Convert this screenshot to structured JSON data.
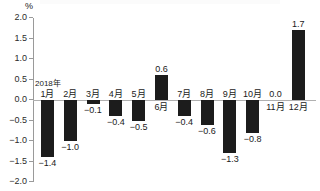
{
  "chart_data": {
    "type": "bar",
    "title": "",
    "subtitle": "",
    "unit_label": "%",
    "xlabel": "",
    "ylabel": "",
    "ylim": [
      -2.0,
      2.0
    ],
    "grid": false,
    "legend": "none",
    "year_annotation": "2018年",
    "categories": [
      "1月",
      "2月",
      "3月",
      "4月",
      "5月",
      "6月",
      "7月",
      "8月",
      "9月",
      "10月",
      "11月",
      "12月"
    ],
    "values": [
      -1.4,
      -1.0,
      -0.1,
      -0.4,
      -0.5,
      0.6,
      -0.4,
      -0.6,
      -1.3,
      -0.8,
      0.0,
      1.7
    ],
    "value_labels": [
      "−1.4",
      "−1.0",
      "−0.1",
      "−0.4",
      "−0.5",
      "0.6",
      "−0.4",
      "−0.6",
      "−1.3",
      "−0.8",
      "0.0",
      "1.7"
    ],
    "y_ticks": [
      2.0,
      1.5,
      1.0,
      0.5,
      0.0,
      -0.5,
      -1.0,
      -1.5,
      -2.0
    ],
    "y_tick_labels": [
      "2.0",
      "1.5",
      "1.0",
      "0.5",
      "0.0",
      "−0.5",
      "−1.0",
      "−1.5",
      "−2.0"
    ],
    "bar_color": "#1c1c1c",
    "axis_color": "#9a9a9a",
    "baseline_color": "#b0b0b0",
    "background_color": "#ffffff"
  }
}
